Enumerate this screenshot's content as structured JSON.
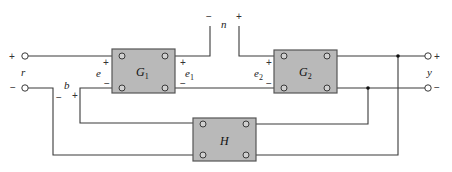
{
  "diagram": {
    "type": "feedback control block diagram",
    "blocks": [
      {
        "id": "G1",
        "label": "G",
        "subscript": "1"
      },
      {
        "id": "G2",
        "label": "G",
        "subscript": "2"
      },
      {
        "id": "H",
        "label": "H",
        "subscript": ""
      }
    ],
    "signals": {
      "input": {
        "label": "r",
        "plus": "+",
        "minus": "−"
      },
      "error": {
        "label": "e",
        "plus": "+",
        "minus": "−"
      },
      "e1": {
        "label": "e",
        "subscript": "1",
        "plus": "+",
        "minus": "−"
      },
      "noise": {
        "label": "n",
        "plus": "+",
        "minus": "−"
      },
      "e2": {
        "label": "e",
        "subscript": "2",
        "plus": "+",
        "minus": "−"
      },
      "feedback": {
        "label": "b",
        "plus": "+",
        "minus": "−"
      },
      "output": {
        "label": "y",
        "plus": "+",
        "minus": "−"
      }
    },
    "colors": {
      "block_fill": "#b9b9b9",
      "wire": "#3a3a3a",
      "background": "#ffffff"
    }
  }
}
